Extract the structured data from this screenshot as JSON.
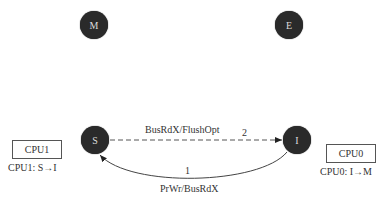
{
  "diagram": {
    "title": "",
    "states": [
      {
        "id": "M",
        "label": "M"
      },
      {
        "id": "E",
        "label": "E"
      },
      {
        "id": "S",
        "label": "S"
      },
      {
        "id": "I",
        "label": "I"
      }
    ],
    "edges": [
      {
        "from": "I",
        "to": "S",
        "step": "1",
        "label": "PrWr/BusRdX",
        "style": "solid"
      },
      {
        "from": "S",
        "to": "I",
        "step": "2",
        "label": "BusRdX/FlushOpt",
        "style": "dashed"
      }
    ],
    "cpus": [
      {
        "name": "CPU1",
        "transition": "CPU1: S→I"
      },
      {
        "name": "CPU0",
        "transition": "CPU0: I→M"
      }
    ]
  },
  "colors": {
    "state_fill": "#2a2a2a",
    "state_text": "#dcdcdc",
    "line": "#444444",
    "text": "#333333"
  }
}
